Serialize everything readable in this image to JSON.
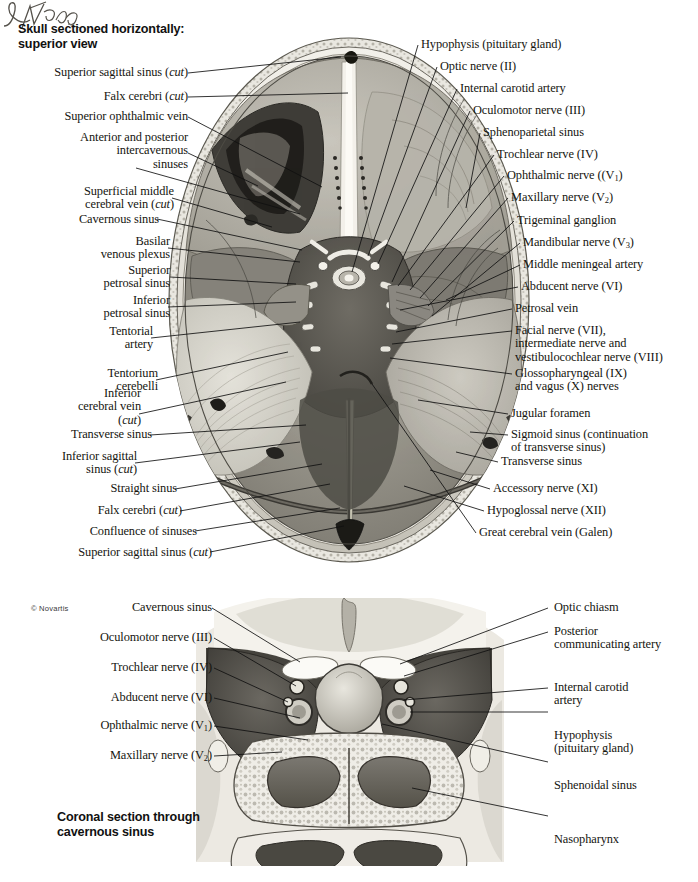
{
  "plate": {
    "top_figure_title": "Skull sectioned horizontally:\nsuperior view",
    "bottom_figure_title": "Coronal section through\ncavernous sinus",
    "artist_signature": "F. Netter",
    "copyright": "© Novartis"
  },
  "top_figure": {
    "left_labels": [
      {
        "id": "superior-sagittal-sinus-cut-top",
        "text": "Superior sagittal sinus (cut)"
      },
      {
        "id": "falx-cerebri-cut-top",
        "text": "Falx cerebri (cut)"
      },
      {
        "id": "superior-ophthalmic-vein",
        "text": "Superior ophthalmic vein"
      },
      {
        "id": "intercavernous-sinuses",
        "text": "Anterior and posterior\nintercavernous\nsinuses"
      },
      {
        "id": "superficial-middle-cerebral-vein",
        "text": "Superficial middle\ncerebral vein (cut)"
      },
      {
        "id": "cavernous-sinus",
        "text": "Cavernous sinus"
      },
      {
        "id": "basilar-venous-plexus",
        "text": "Basilar\nvenous plexus"
      },
      {
        "id": "superior-petrosal-sinus",
        "text": "Superior\npetrosal sinus"
      },
      {
        "id": "inferior-petrosal-sinus",
        "text": "Inferior\npetrosal sinus"
      },
      {
        "id": "tentorial-artery",
        "text": "Tentorial\nartery"
      },
      {
        "id": "tentorium-cerebelli",
        "text": "Tentorium\ncerebelli"
      },
      {
        "id": "inferior-cerebral-vein-cut",
        "text": "Inferior\ncerebral vein\n(cut)"
      },
      {
        "id": "transverse-sinus-left",
        "text": "Transverse sinus"
      },
      {
        "id": "inferior-sagittal-sinus-cut",
        "text": "Inferior sagittal\nsinus (cut)"
      },
      {
        "id": "straight-sinus",
        "text": "Straight sinus"
      },
      {
        "id": "falx-cerebri-cut-bottom",
        "text": "Falx cerebri (cut)"
      },
      {
        "id": "confluence-of-sinuses",
        "text": "Confluence of sinuses"
      },
      {
        "id": "superior-sagittal-sinus-cut-bottom",
        "text": "Superior sagittal sinus (cut)"
      }
    ],
    "right_labels": [
      {
        "id": "hypophysis-pituitary-gland",
        "text": "Hypophysis (pituitary gland)"
      },
      {
        "id": "optic-nerve-ii",
        "text": "Optic nerve (II)"
      },
      {
        "id": "internal-carotid-artery",
        "text": "Internal carotid artery"
      },
      {
        "id": "oculomotor-nerve-iii",
        "text": "Oculomotor nerve (III)"
      },
      {
        "id": "sphenoparietal-sinus",
        "text": "Sphenoparietal sinus"
      },
      {
        "id": "trochlear-nerve-iv",
        "text": "Trochlear nerve (IV)"
      },
      {
        "id": "ophthalmic-nerve-v1",
        "text": "Ophthalmic nerve ((V1)"
      },
      {
        "id": "maxillary-nerve-v2",
        "text": "Maxillary nerve (V2)"
      },
      {
        "id": "trigeminal-ganglion",
        "text": "Trigeminal ganglion"
      },
      {
        "id": "mandibular-nerve-v3",
        "text": "Mandibular nerve (V3)"
      },
      {
        "id": "middle-meningeal-artery",
        "text": "Middle meningeal artery"
      },
      {
        "id": "abducent-nerve-vi",
        "text": "Abducent nerve (VI)"
      },
      {
        "id": "petrosal-vein",
        "text": "Petrosal vein"
      },
      {
        "id": "facial-nerve-vii",
        "text": "Facial nerve (VII),\nintermediate nerve and\nvestibulocochlear nerve (VIII)"
      },
      {
        "id": "glossopharyngeal-vagus",
        "text": "Glossopharyngeal (IX)\nand vagus (X) nerves"
      },
      {
        "id": "jugular-foramen",
        "text": "Jugular foramen"
      },
      {
        "id": "sigmoid-sinus",
        "text": "Sigmoid sinus (continuation\nof transverse sinus)"
      },
      {
        "id": "transverse-sinus-right",
        "text": "Transverse sinus"
      },
      {
        "id": "accessory-nerve-xi",
        "text": "Accessory nerve (XI)"
      },
      {
        "id": "hypoglossal-nerve-xii",
        "text": "Hypoglossal nerve (XII)"
      },
      {
        "id": "great-cerebral-vein-galen",
        "text": "Great cerebral vein (Galen)"
      }
    ]
  },
  "bottom_figure": {
    "left_labels": [
      {
        "id": "cavernous-sinus-coronal",
        "text": "Cavernous sinus"
      },
      {
        "id": "oculomotor-nerve-iii-coronal",
        "text": "Oculomotor nerve (III)"
      },
      {
        "id": "trochlear-nerve-iv-coronal",
        "text": "Trochlear nerve (IV)"
      },
      {
        "id": "abducent-nerve-vi-coronal",
        "text": "Abducent nerve (VI)"
      },
      {
        "id": "ophthalmic-nerve-v1-coronal",
        "text": "Ophthalmic nerve (V1)"
      },
      {
        "id": "maxillary-nerve-v2-coronal",
        "text": "Maxillary nerve (V2)"
      }
    ],
    "right_labels": [
      {
        "id": "optic-chiasm",
        "text": "Optic chiasm"
      },
      {
        "id": "posterior-communicating-artery",
        "text": "Posterior\ncommunicating artery"
      },
      {
        "id": "internal-carotid-artery-coronal",
        "text": "Internal carotid\nartery"
      },
      {
        "id": "hypophysis-coronal",
        "text": "Hypophysis\n(pituitary gland)"
      },
      {
        "id": "sphenoidal-sinus",
        "text": "Sphenoidal sinus"
      },
      {
        "id": "nasopharynx",
        "text": "Nasopharynx"
      }
    ]
  },
  "colors": {
    "ink": "#15150f",
    "leader": "#111111",
    "paper": "#ffffff"
  }
}
